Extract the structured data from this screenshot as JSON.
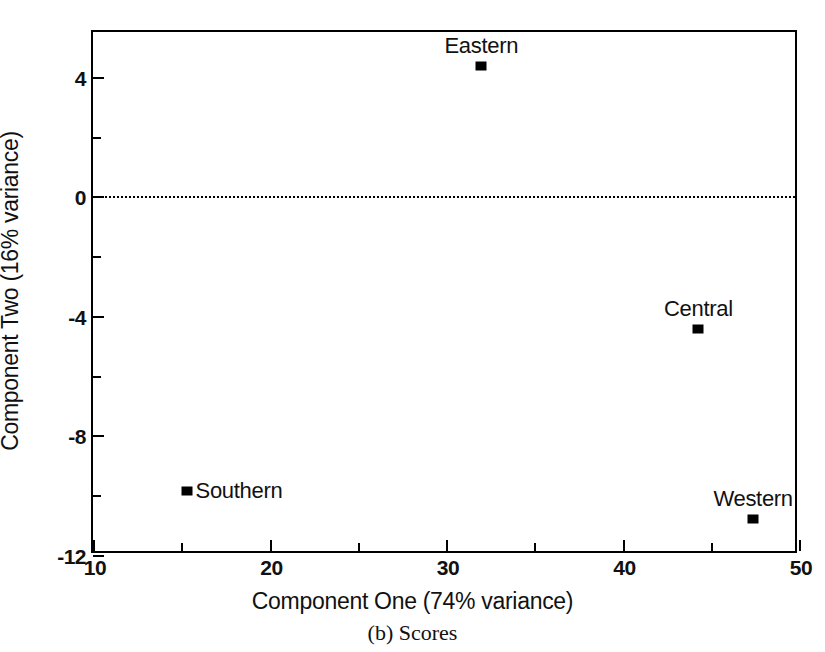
{
  "chart_data": {
    "type": "scatter",
    "title": "",
    "caption": "(b) Scores",
    "xlabel": "Component One (74% variance)",
    "ylabel": "Component Two (16% variance)",
    "xlim": [
      10,
      50
    ],
    "ylim": [
      -12,
      5.5
    ],
    "grid": false,
    "legend": "none",
    "x_major_ticks": [
      10,
      20,
      30,
      40,
      50
    ],
    "x_major_tick_labels": [
      "10",
      "20",
      "30",
      "40",
      "50"
    ],
    "x_minor_ticks": [
      15,
      25,
      35,
      45
    ],
    "y_major_ticks": [
      4,
      0,
      -4,
      -8,
      -12
    ],
    "y_major_tick_labels": [
      "4",
      "0",
      "-4",
      "-8",
      "-12"
    ],
    "y_minor_ticks": [
      2,
      -2,
      -6,
      -10
    ],
    "reference_line": {
      "axis": "y",
      "value": 0,
      "style": "dotted"
    },
    "points": [
      {
        "label": "Eastern",
        "x": 32.0,
        "y": 4.35,
        "label_position": "above"
      },
      {
        "label": "Central",
        "x": 44.3,
        "y": -4.45,
        "label_position": "above"
      },
      {
        "label": "Southern",
        "x": 15.3,
        "y": -9.85,
        "label_position": "right"
      },
      {
        "label": "Western",
        "x": 47.4,
        "y": -10.8,
        "label_position": "above"
      }
    ]
  },
  "colors": {
    "axis": "#000000",
    "marker": "#000000",
    "background": "#ffffff"
  }
}
